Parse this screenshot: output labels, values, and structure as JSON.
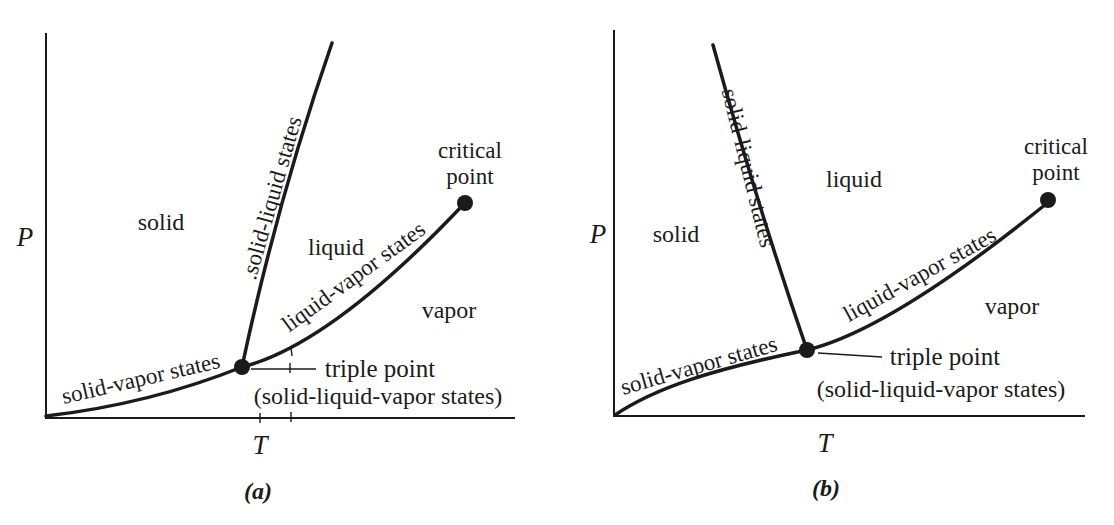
{
  "figure": {
    "background_color": "#ffffff",
    "line_color": "#1b1b1b",
    "panels": [
      {
        "caption": "(a)",
        "axes": {
          "y": "P",
          "x": "T"
        },
        "regions": {
          "solid": "solid",
          "liquid": "liquid",
          "vapor": "vapor"
        },
        "curves": {
          "solid_liquid": ".solid-liquid states",
          "liquid_vapor": "liquid-vapor states",
          "solid_vapor": "solid-vapor states"
        },
        "critical_point": {
          "line1": "critical",
          "line2": "point"
        },
        "triple_point": {
          "label": "triple point",
          "sublabel": "(solid-liquid-vapor states)"
        }
      },
      {
        "caption": "(b)",
        "axes": {
          "y": "P",
          "x": "T"
        },
        "regions": {
          "solid": "solid",
          "liquid": "liquid",
          "vapor": "vapor"
        },
        "curves": {
          "solid_liquid": "solid-liquid states",
          "liquid_vapor": "liquid-vapor states",
          "solid_vapor": "solid-vapor states"
        },
        "critical_point": {
          "line1": "critical",
          "line2": "point"
        },
        "triple_point": {
          "label": "triple point",
          "sublabel": "(solid-liquid-vapor states)"
        }
      }
    ]
  }
}
